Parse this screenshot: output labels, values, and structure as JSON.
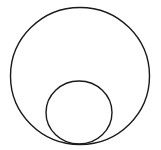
{
  "diagram": {
    "canvas": {
      "width": 161,
      "height": 150,
      "background": "#ffffff"
    },
    "stroke_color": "#1a1a1a",
    "stroke_width": 1.4,
    "shapes": [
      {
        "name": "outer-circle",
        "type": "ellipse",
        "cx": 80,
        "cy": 76,
        "rx": 69.5,
        "ry": 68.5
      },
      {
        "name": "inner-circle",
        "type": "ellipse",
        "cx": 79,
        "cy": 112.5,
        "rx": 33,
        "ry": 31.5
      }
    ],
    "tangent_point": {
      "x": 79,
      "y": 144
    }
  }
}
